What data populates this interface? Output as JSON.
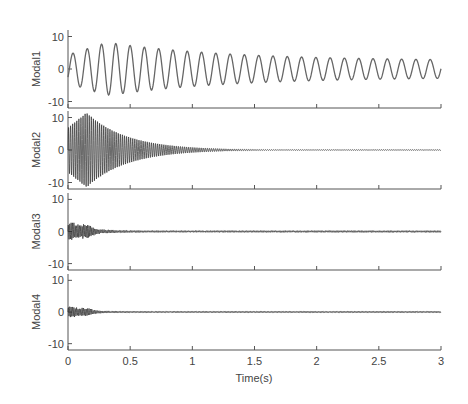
{
  "chart_data": {
    "type": "line",
    "title": "",
    "xlabel": "Time(s)",
    "xlim": [
      0,
      3
    ],
    "xticks": [
      0,
      0.5,
      1,
      1.5,
      2,
      2.5,
      3
    ],
    "xtick_labels": [
      "0",
      "0.5",
      "1",
      "1.5",
      "2",
      "2.5",
      "3"
    ],
    "grid": false,
    "legend": null,
    "line_color": "#555555",
    "panels": [
      {
        "name": "Modal1",
        "ylabel": "Modal1",
        "ylim": [
          -12,
          12
        ],
        "yticks": [
          10,
          0,
          -10
        ],
        "ytick_labels": [
          "10",
          "0",
          "-10"
        ],
        "signal": {
          "kind": "damped_sine",
          "frequency_hz": 8.7,
          "peak_amplitude": 8,
          "peak_time_s": 0.35,
          "final_amplitude": 2.5,
          "rise_time_s": 0.3
        }
      },
      {
        "name": "Modal2",
        "ylabel": "Modal2",
        "ylim": [
          -12,
          12
        ],
        "yticks": [
          10,
          0,
          -10
        ],
        "ytick_labels": [
          "10",
          "0",
          "-10"
        ],
        "signal": {
          "kind": "damped_sine",
          "frequency_hz": 60,
          "peak_amplitude": 11.5,
          "peak_time_s": 0.15,
          "final_amplitude": 0.1,
          "decay_to_zero_s": 1.35
        }
      },
      {
        "name": "Modal3",
        "ylabel": "Modal3",
        "ylim": [
          -12,
          12
        ],
        "yticks": [
          10,
          0,
          -10
        ],
        "ytick_labels": [
          "10",
          "0",
          "-10"
        ],
        "signal": {
          "kind": "bursts",
          "initial_amplitude": 2.5,
          "peak_time_s": 0.05,
          "decay_s": 0.35,
          "residual_amplitude": 0.3
        }
      },
      {
        "name": "Modal4",
        "ylabel": "Modal4",
        "ylim": [
          -12,
          12
        ],
        "yticks": [
          10,
          0,
          -10
        ],
        "ytick_labels": [
          "10",
          "0",
          "-10"
        ],
        "signal": {
          "kind": "bursts",
          "initial_amplitude": 1.5,
          "peak_time_s": 0.05,
          "decay_s": 0.3,
          "residual_amplitude": 0.25
        }
      }
    ]
  }
}
